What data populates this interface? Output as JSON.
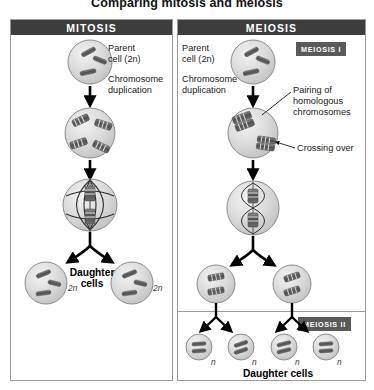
{
  "figure": {
    "title": "Comparing mitosis and meiosis"
  },
  "panels": {
    "mitosis": {
      "header": "MITOSIS",
      "labels": {
        "parent_cell": "Parent\ncell (2n)",
        "chromosome_duplication": "Chromosome\nduplication",
        "daughter_cells": "Daughter\ncells"
      },
      "ploidy": {
        "daughter_left": "2n",
        "daughter_right": "2n"
      },
      "stages": [
        {
          "name": "parent-cell",
          "ploidy": "2n",
          "chromosomes": 3,
          "duplicated": false
        },
        {
          "name": "duplicated-cell",
          "ploidy": "2n",
          "chromosomes": 4,
          "duplicated": true
        },
        {
          "name": "metaphase-cell",
          "ploidy": "2n",
          "chromosomes": 2,
          "duplicated": true,
          "spindle": true
        },
        {
          "name": "daughter-cell-left",
          "ploidy": "2n",
          "chromosomes": 3,
          "duplicated": false
        },
        {
          "name": "daughter-cell-right",
          "ploidy": "2n",
          "chromosomes": 3,
          "duplicated": false
        }
      ]
    },
    "meiosis": {
      "header": "MEIOSIS",
      "badges": {
        "phase_one": "MEIOSIS I",
        "phase_two": "MEIOSIS II"
      },
      "labels": {
        "parent_cell": "Parent\ncell (2n)",
        "chromosome_duplication": "Chromosome\nduplication",
        "pairing": "Pairing of\nhomologous\nchromosomes",
        "crossing_over": "Crossing over",
        "daughter_cells": "Daughter cells"
      },
      "ploidy": {
        "daughter_1": "n",
        "daughter_2": "n",
        "daughter_3": "n",
        "daughter_4": "n"
      },
      "stages": [
        {
          "name": "parent-cell",
          "ploidy": "2n",
          "chromosomes": 3,
          "duplicated": false
        },
        {
          "name": "paired-homologues-cell",
          "ploidy": "2n",
          "pairs": 2,
          "crossing_over": true
        },
        {
          "name": "metaphase-i-cell",
          "ploidy": "2n",
          "pairs": 2,
          "spindle": true
        },
        {
          "name": "intermediate-cell-left",
          "ploidy": "n",
          "chromosomes": 2,
          "duplicated": true
        },
        {
          "name": "intermediate-cell-right",
          "ploidy": "n",
          "chromosomes": 2,
          "duplicated": true
        },
        {
          "name": "daughter-cell-1",
          "ploidy": "n",
          "chromosomes": 2,
          "duplicated": false
        },
        {
          "name": "daughter-cell-2",
          "ploidy": "n",
          "chromosomes": 2,
          "duplicated": false
        },
        {
          "name": "daughter-cell-3",
          "ploidy": "n",
          "chromosomes": 2,
          "duplicated": false
        },
        {
          "name": "daughter-cell-4",
          "ploidy": "n",
          "chromosomes": 2,
          "duplicated": false
        }
      ]
    }
  },
  "colors": {
    "header_bar": "#3d3d3d",
    "badge": "#5a5a5a",
    "panel_border": "#9a9a9a",
    "cell_fill": "#d9d9d9",
    "cell_stroke": "#8d8d8d",
    "chromosome": "#5e5e5e",
    "arrow": "#000000",
    "text": "#1a1a1a",
    "background": "#ffffff"
  }
}
